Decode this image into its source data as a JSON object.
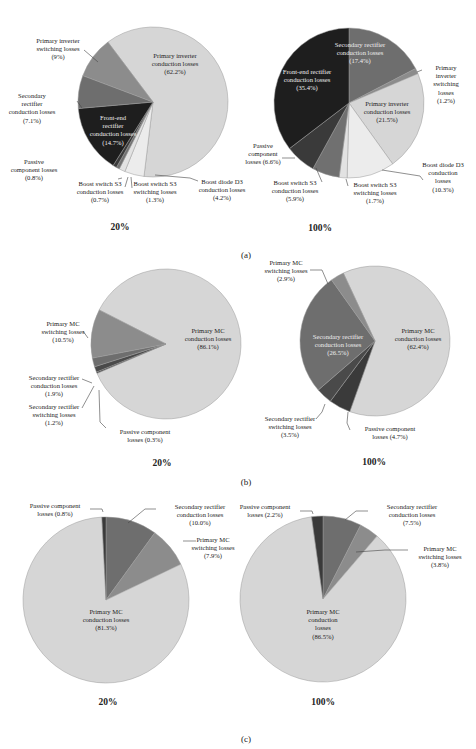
{
  "figure": {
    "panels": [
      {
        "label": "(a)"
      },
      {
        "label": "(b)"
      },
      {
        "label": "(c)"
      }
    ]
  },
  "chart_data": [
    {
      "type": "pie",
      "panel": "(a)",
      "title": "20%",
      "slices": [
        {
          "name": "Primary inverter conduction losses",
          "value": 62.2,
          "color": "#d6d6d6"
        },
        {
          "name": "Primary inverter switching losses",
          "value": 9.0,
          "color": "#8c8c8c"
        },
        {
          "name": "Secondary rectifier conduction losses",
          "value": 7.1,
          "color": "#6e6e6e"
        },
        {
          "name": "Front-end rectifier conduction losses",
          "value": 14.7,
          "color": "#1e1e1e"
        },
        {
          "name": "Passive component losses",
          "value": 0.8,
          "color": "#3a3a3a"
        },
        {
          "name": "Boost switch S3 conduction losses",
          "value": 0.7,
          "color": "#707070"
        },
        {
          "name": "Boost switch S3 switching losses",
          "value": 1.3,
          "color": "#e2e2e2"
        },
        {
          "name": "Boost diode D3 conduction losses",
          "value": 4.2,
          "color": "#ececec"
        }
      ]
    },
    {
      "type": "pie",
      "panel": "(a)",
      "title": "100%",
      "slices": [
        {
          "name": "Secondary rectifier conduction losses",
          "value": 17.4,
          "color": "#6e6e6e"
        },
        {
          "name": "Primary inverter switching losses",
          "value": 1.2,
          "color": "#8c8c8c"
        },
        {
          "name": "Primary inverter conduction losses",
          "value": 21.5,
          "color": "#d6d6d6"
        },
        {
          "name": "Boost diode D3 conduction losses",
          "value": 10.3,
          "color": "#ececec"
        },
        {
          "name": "Boost switch S3 switching losses",
          "value": 1.7,
          "color": "#e2e2e2"
        },
        {
          "name": "Boost switch S3 conduction losses",
          "value": 5.9,
          "color": "#707070"
        },
        {
          "name": "Passive component losses",
          "value": 6.6,
          "color": "#3a3a3a"
        },
        {
          "name": "Front-end rectifier conduction losses",
          "value": 35.4,
          "color": "#1e1e1e"
        }
      ]
    },
    {
      "type": "pie",
      "panel": "(b)",
      "title": "20%",
      "slices": [
        {
          "name": "Primary MC conduction losses",
          "value": 86.1,
          "color": "#d6d6d6"
        },
        {
          "name": "Passive component losses",
          "value": 0.3,
          "color": "#3a3a3a"
        },
        {
          "name": "Secondary rectifier switching losses",
          "value": 1.2,
          "color": "#4a4a4a"
        },
        {
          "name": "Secondary rectifier conduction losses",
          "value": 1.9,
          "color": "#6e6e6e"
        },
        {
          "name": "Primary MC switching losses",
          "value": 10.5,
          "color": "#8c8c8c"
        }
      ]
    },
    {
      "type": "pie",
      "panel": "(b)",
      "title": "100%",
      "slices": [
        {
          "name": "Primary MC conduction losses",
          "value": 62.4,
          "color": "#d6d6d6"
        },
        {
          "name": "Passive component losses",
          "value": 4.7,
          "color": "#3a3a3a"
        },
        {
          "name": "Secondary rectifier switching losses",
          "value": 3.5,
          "color": "#4a4a4a"
        },
        {
          "name": "Secondary rectifier conduction losses",
          "value": 26.5,
          "color": "#6e6e6e"
        },
        {
          "name": "Primary MC switching losses",
          "value": 2.9,
          "color": "#8c8c8c"
        }
      ]
    },
    {
      "type": "pie",
      "panel": "(c)",
      "title": "20%",
      "slices": [
        {
          "name": "Secondary rectifier conduction losses",
          "value": 10.0,
          "color": "#6e6e6e"
        },
        {
          "name": "Primary MC switching losses",
          "value": 7.9,
          "color": "#8c8c8c"
        },
        {
          "name": "Primary MC conduction losses",
          "value": 81.3,
          "color": "#d6d6d6"
        },
        {
          "name": "Passive component losses",
          "value": 0.8,
          "color": "#3a3a3a"
        }
      ]
    },
    {
      "type": "pie",
      "panel": "(c)",
      "title": "100%",
      "slices": [
        {
          "name": "Secondary rectifier conduction losses",
          "value": 7.5,
          "color": "#6e6e6e"
        },
        {
          "name": "Primary MC switching losses",
          "value": 3.8,
          "color": "#8c8c8c"
        },
        {
          "name": "Primary MC conduction losses",
          "value": 86.5,
          "color": "#d6d6d6"
        },
        {
          "name": "Passive component losses",
          "value": 2.2,
          "color": "#3a3a3a"
        }
      ]
    }
  ],
  "labels": {
    "a20": {
      "pic": [
        "Primary inverter",
        "conduction losses",
        "(62.2%)"
      ],
      "pis": [
        "Primary inverter",
        "switching losses",
        "(9%)"
      ],
      "src": [
        "Secondary",
        "rectifier",
        "conduction losses",
        "(7.1%)"
      ],
      "fer": [
        "Front-end",
        "rectifier",
        "conduction losses",
        "(14.7%)"
      ],
      "pas": [
        "Passive",
        "component losses",
        "(0.8%)"
      ],
      "bsc": [
        "Boost switch S3",
        "conduction losses",
        "(0.7%)"
      ],
      "bss": [
        "Boost switch S3",
        "switching losses",
        "(1.3%)"
      ],
      "bdc": [
        "Boost diode D3",
        "conduction losses",
        "(4.2%)"
      ]
    },
    "a100": {
      "src": [
        "Secondary rectifier",
        "conduction losses",
        "(17.4%)"
      ],
      "pis": [
        "Primary",
        "inverter",
        "switching",
        "losses",
        "(1.2%)"
      ],
      "fer": [
        "Front-end rectifier",
        "conduction losses",
        "(35.4%)"
      ],
      "pic": [
        "Primary inverter",
        "conduction losses",
        "(21.5%)"
      ],
      "pas": [
        "Passive",
        "component",
        "losses (6.6%)"
      ],
      "bdc": [
        "Boost diode D3",
        "conduction",
        "losses",
        "(10.3%)"
      ],
      "bsc": [
        "Boost switch S3",
        "conduction losses",
        "(5.9%)"
      ],
      "bss": [
        "Boost switch S3",
        "switching losses",
        "(1.7%)"
      ]
    },
    "b20": {
      "mcs": [
        "Primary MC",
        "switching losses",
        "(10.5%)"
      ],
      "mcc": [
        "Primary MC",
        "conduction losses",
        "(86.1%)"
      ],
      "src": [
        "Secondary rectifier",
        "conduction losses",
        "(1.9%)"
      ],
      "srs": [
        "Secondary rectifier",
        "switching losses",
        "(1.2%)"
      ],
      "pas": [
        "Passive component",
        "losses (0.3%)"
      ]
    },
    "b100": {
      "mcs": [
        "Primary MC",
        "switching losses",
        "(2.9%)"
      ],
      "src": [
        "Secondary rectifier",
        "conduction losses",
        "(26.5%)"
      ],
      "mcc": [
        "Primary MC",
        "conduction losses",
        "(62.4%)"
      ],
      "srs": [
        "Secondary rectifier",
        "switching losses",
        "(3.5%)"
      ],
      "pas": [
        "Passive component",
        "losses (4.7%)"
      ]
    },
    "c20": {
      "pas": [
        "Passive component",
        "losses (0.8%)"
      ],
      "src": [
        "Secondary rectifier",
        "conduction losses",
        "(10.0%)"
      ],
      "mcs": [
        "Primary MC",
        "switching losses",
        "(7.9%)"
      ],
      "mcc": [
        "Primary MC",
        "conduction losses",
        "(81.3%)"
      ]
    },
    "c100": {
      "pas": [
        "Passive component",
        "losses (2.2%)"
      ],
      "src": [
        "Secondary rectifier",
        "conduction losses",
        "(7.5%)"
      ],
      "mcs": [
        "Primary MC",
        "switching losses",
        "(3.8%)"
      ],
      "mcc": [
        "Primary MC",
        "conduction",
        "losses",
        "(86.5%)"
      ]
    }
  },
  "captions": {
    "a20": "20%",
    "a100": "100%",
    "b20": "20%",
    "b100": "100%",
    "c20": "20%",
    "c100": "100%"
  }
}
